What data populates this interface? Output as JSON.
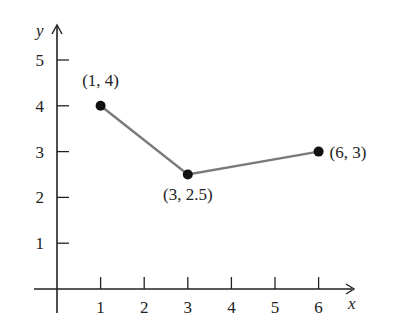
{
  "chart_data": {
    "type": "line",
    "title": "",
    "xlabel": "x",
    "ylabel": "y",
    "x": [
      1,
      3,
      6
    ],
    "y": [
      4,
      2.5,
      3
    ],
    "series": [
      {
        "name": "polyline",
        "x": [
          1,
          3,
          6
        ],
        "values": [
          4,
          2.5,
          3
        ],
        "color": "#7a7a7a"
      }
    ],
    "points": [
      {
        "x": 1,
        "y": 4,
        "label": "(1, 4)"
      },
      {
        "x": 3,
        "y": 2.5,
        "label": "(3, 2.5)"
      },
      {
        "x": 6,
        "y": 3,
        "label": "(6, 3)"
      }
    ],
    "x_ticks": [
      "1",
      "2",
      "3",
      "4",
      "5",
      "6"
    ],
    "y_ticks": [
      "1",
      "2",
      "3",
      "4",
      "5"
    ],
    "xlim": [
      0,
      6.5
    ],
    "ylim": [
      0,
      5.5
    ],
    "grid": false,
    "legend": null
  },
  "colors": {
    "axis": "#222222",
    "line": "#7a7a7a",
    "marker": "#111111"
  }
}
